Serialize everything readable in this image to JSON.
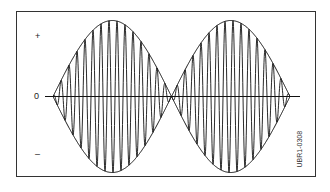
{
  "figure": {
    "labels": {
      "plus": "+",
      "zero": "0",
      "minus": "–"
    },
    "figure_id": "UBR1-0308"
  },
  "waveform": {
    "type": "amplitude-modulated sine (beat pattern)",
    "axis": {
      "x_start": 45,
      "x_end": 300,
      "y": 96.5
    },
    "envelope_nodes_x": [
      53,
      172,
      290
    ],
    "amplitude_px": 76,
    "carrier_period_px": 8,
    "stroke_color": "#111111"
  }
}
